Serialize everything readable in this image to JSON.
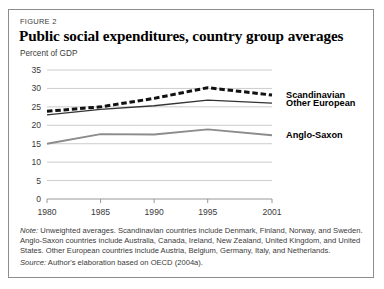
{
  "figure": {
    "label": "FIGURE 2",
    "title": "Public social expenditures, country group averages",
    "unit_label": "Percent of GDP"
  },
  "notes": {
    "note_prefix": "Note:",
    "note_lines": [
      " Unweighted averages. Scandinavian countries include Denmark, Finland, Norway, and Sweden.",
      "Anglo-Saxon countries include Australia, Canada, Ireland, New Zealand, United Kingdom, and United",
      "States. Other European countries include Austria, Belgium, Germany, Italy, and Netherlands."
    ],
    "source_prefix": "Source:",
    "source_text": " Author's elaboration based on OECD (2004a)."
  },
  "colors": {
    "scandinavian": "#111111",
    "other_european": "#333333",
    "anglo_saxon": "#8c8c8c",
    "gridline": "#bfbfbf",
    "axis": "#8d8d8d",
    "border": "#8d8d8d",
    "text": "#3a3a3a",
    "background": "#ffffff"
  },
  "chart_data": {
    "type": "line",
    "title": "Public social expenditures, country group averages",
    "xlabel": "",
    "ylabel": "Percent of GDP",
    "ylim": [
      0,
      35
    ],
    "xlim": [
      1980,
      2001
    ],
    "grid": true,
    "legend_position": "right-inline",
    "x": [
      1980,
      1985,
      1990,
      1995,
      2001
    ],
    "xticklabels": [
      "1980",
      "1985",
      "1990",
      "1995",
      "2001"
    ],
    "yticks": [
      0,
      5,
      10,
      15,
      20,
      25,
      30,
      35
    ],
    "yticklabels": [
      "0",
      "5",
      "10",
      "15",
      "20",
      "25",
      "30",
      "35"
    ],
    "series": [
      {
        "name": "Scandinavian",
        "style": "dashed",
        "color": "#111111",
        "width": 3.0,
        "values": [
          23.8,
          25.0,
          27.3,
          30.2,
          28.2
        ]
      },
      {
        "name": "Other European",
        "style": "solid",
        "color": "#333333",
        "width": 1.3,
        "values": [
          22.8,
          24.3,
          25.3,
          26.8,
          26.0
        ]
      },
      {
        "name": "Anglo-Saxon",
        "style": "solid",
        "color": "#8c8c8c",
        "width": 1.9,
        "values": [
          15.0,
          17.6,
          17.5,
          18.9,
          17.3
        ]
      }
    ]
  }
}
